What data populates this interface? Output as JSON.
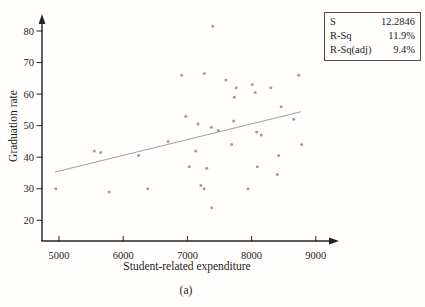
{
  "figure": {
    "caption": "(a)",
    "x_axis_label": "Student-related expenditure",
    "y_axis_label": "Graduation rate"
  },
  "stats_box": {
    "rows": [
      {
        "label": "S",
        "value": "12.2846"
      },
      {
        "label": "R-Sq",
        "value": "11.9%"
      },
      {
        "label": "R-Sq(adj)",
        "value": "9.4%"
      }
    ]
  },
  "chart_data": {
    "type": "scatter",
    "title": "",
    "xlabel": "Student-related expenditure",
    "ylabel": "Graduation rate",
    "x_ticks": [
      5000,
      6000,
      7000,
      8000,
      9000
    ],
    "y_ticks": [
      20,
      30,
      40,
      50,
      60,
      70,
      80
    ],
    "xlim": [
      4735,
      9330
    ],
    "ylim": [
      13,
      85
    ],
    "grid": false,
    "legend_position": "top-right",
    "legend_stats": {
      "S": 12.2846,
      "R-Sq": "11.9%",
      "R-Sq(adj)": "9.4%"
    },
    "points": [
      [
        4950,
        30
      ],
      [
        5550,
        42
      ],
      [
        5650,
        41.5
      ],
      [
        5780,
        29
      ],
      [
        6240,
        40.5
      ],
      [
        6380,
        30
      ],
      [
        6700,
        45
      ],
      [
        6910,
        66
      ],
      [
        6975,
        53
      ],
      [
        7030,
        37
      ],
      [
        7130,
        42
      ],
      [
        7165,
        50.5
      ],
      [
        7210,
        31
      ],
      [
        7260,
        30
      ],
      [
        7265,
        66.5
      ],
      [
        7300,
        36.5
      ],
      [
        7370,
        49.5
      ],
      [
        7380,
        24
      ],
      [
        7395,
        81.5
      ],
      [
        7480,
        48.5
      ],
      [
        7600,
        64.5
      ],
      [
        7690,
        44
      ],
      [
        7720,
        51.5
      ],
      [
        7730,
        59
      ],
      [
        7760,
        62
      ],
      [
        7945,
        30
      ],
      [
        8010,
        63
      ],
      [
        8055,
        60.5
      ],
      [
        8080,
        48
      ],
      [
        8090,
        37
      ],
      [
        8150,
        47
      ],
      [
        8300,
        62
      ],
      [
        8400,
        34.5
      ],
      [
        8420,
        40.5
      ],
      [
        8460,
        56
      ],
      [
        8655,
        52
      ],
      [
        8735,
        66
      ],
      [
        8780,
        44
      ]
    ],
    "regression_line": {
      "x1": 4940,
      "y1": 35.3,
      "x2": 8770,
      "y2": 54.4
    },
    "colors": {
      "point": "#9e9e9e",
      "line": "#a3a3a3",
      "axis": "#222222",
      "text": "#1c1c1c"
    }
  }
}
